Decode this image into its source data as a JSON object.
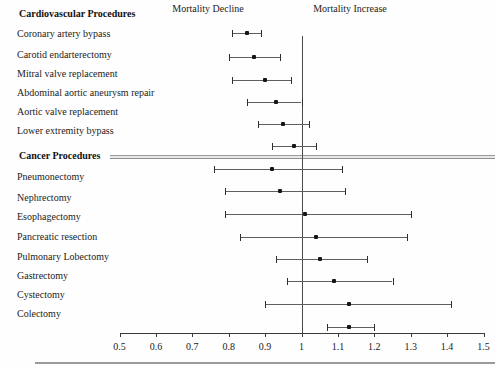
{
  "chart_data": {
    "type": "forest",
    "title": "",
    "column_headers": {
      "left": "Mortality Decline",
      "right": "Mortality Increase"
    },
    "x_axis": {
      "min": 0.5,
      "max": 1.5,
      "tick_labels": [
        "0.5",
        "0.6",
        "0.7",
        "0.8",
        "0.9",
        "1",
        "1.1",
        "1.2",
        "1.3",
        "1.4",
        "1.5"
      ],
      "reference_line": 1
    },
    "groups": [
      {
        "label": "Cardiovascular Procedures",
        "items": [
          {
            "label": "Coronary artery bypass",
            "estimate": 0.85,
            "ci_low": 0.81,
            "ci_high": 0.89
          },
          {
            "label": "Carotid endarterectomy",
            "estimate": 0.87,
            "ci_low": 0.8,
            "ci_high": 0.94
          },
          {
            "label": "Mitral valve replacement",
            "estimate": 0.9,
            "ci_low": 0.81,
            "ci_high": 0.97
          },
          {
            "label": "Abdominal aortic aneurysm repair",
            "estimate": 0.93,
            "ci_low": 0.85,
            "ci_high": 1.0
          },
          {
            "label": "Aortic valve replacement",
            "estimate": 0.95,
            "ci_low": 0.88,
            "ci_high": 1.02
          },
          {
            "label": "Lower extremity bypass",
            "estimate": 0.98,
            "ci_low": 0.92,
            "ci_high": 1.04
          }
        ]
      },
      {
        "label": "Cancer Procedures",
        "items": [
          {
            "label": "Pneumonectomy",
            "estimate": 0.92,
            "ci_low": 0.76,
            "ci_high": 1.11
          },
          {
            "label": "Nephrectomy",
            "estimate": 0.94,
            "ci_low": 0.79,
            "ci_high": 1.12
          },
          {
            "label": "Esophagectomy",
            "estimate": 1.01,
            "ci_low": 0.79,
            "ci_high": 1.3
          },
          {
            "label": "Pancreatic resection",
            "estimate": 1.04,
            "ci_low": 0.83,
            "ci_high": 1.29
          },
          {
            "label": "Pulmonary Lobectomy",
            "estimate": 1.05,
            "ci_low": 0.93,
            "ci_high": 1.18
          },
          {
            "label": "Gastrectomy",
            "estimate": 1.09,
            "ci_low": 0.96,
            "ci_high": 1.25
          },
          {
            "label": "Cystectomy",
            "estimate": 1.13,
            "ci_low": 0.9,
            "ci_high": 1.41
          },
          {
            "label": "Colectomy",
            "estimate": 1.13,
            "ci_low": 1.07,
            "ci_high": 1.2
          }
        ]
      }
    ],
    "layout_hints": {
      "grid": false,
      "legend": false,
      "reference_line_at": 1
    }
  },
  "colors": {
    "ci_line": "#5f5f5f",
    "point_marker": "#161616",
    "reference_line": "#4a4a4a",
    "separator_rule": "#9a9a9a",
    "text": "#1b1b1b"
  }
}
